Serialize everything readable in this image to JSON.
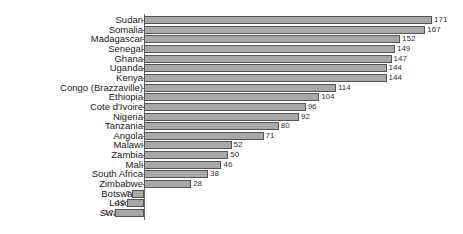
{
  "chart_data": {
    "type": "bar",
    "orientation": "horizontal",
    "title": "",
    "xlabel": "",
    "ylabel": "",
    "grid": false,
    "legend": null,
    "categories": [
      "Sudan",
      "Somalia",
      "Madagascar",
      "Senegal",
      "Ghana",
      "Uganda",
      "Kenya",
      "Congo (Brazzaville)",
      "Ethiopia",
      "Cote d'Ivoire",
      "Nigeria",
      "Tanzania",
      "Angola",
      "Malawi",
      "Zambia",
      "Mali",
      "South Africa",
      "Zimbabwe",
      "Botswana",
      "Lesotho",
      "Swaziland"
    ],
    "values": [
      171,
      167,
      152,
      149,
      147,
      144,
      144,
      114,
      104,
      96,
      92,
      80,
      71,
      52,
      50,
      46,
      38,
      28,
      -7,
      -10,
      -17
    ],
    "data_labels": [
      "171",
      "167",
      "152",
      "149",
      "147",
      "144",
      "144",
      "114",
      "104",
      "96",
      "92",
      "80",
      "71",
      "52",
      "50",
      "46",
      "38",
      "28",
      "-7",
      "-10",
      "-17"
    ],
    "xlim": [
      -17,
      171
    ],
    "colors": {
      "bar_fill": "#a8a8a8",
      "bar_edge": "#555555",
      "axis": "#666666"
    }
  }
}
